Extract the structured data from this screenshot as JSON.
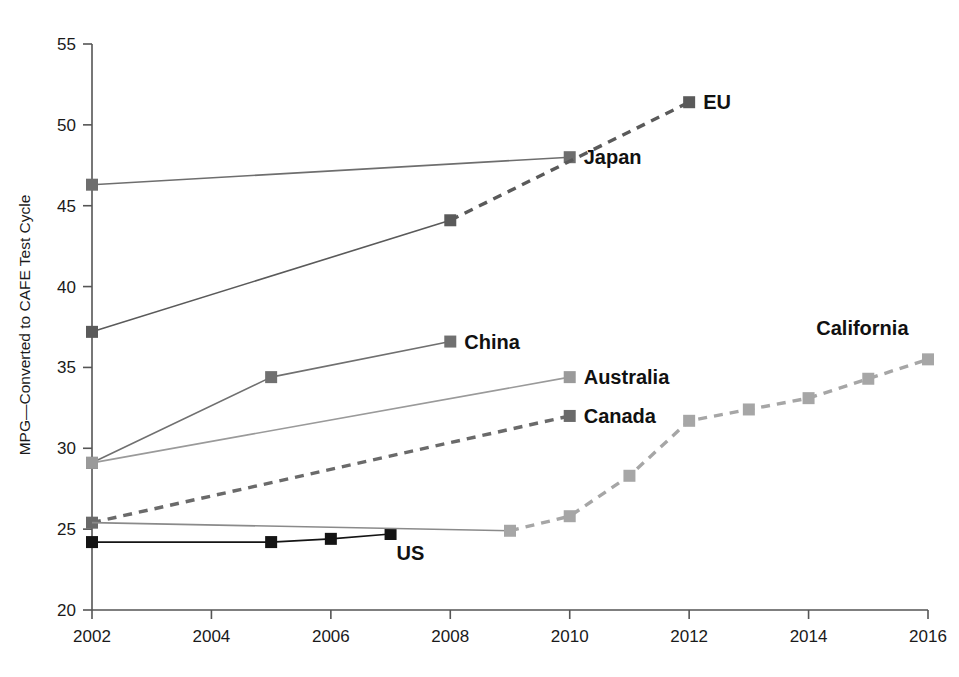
{
  "chart_data": {
    "type": "line",
    "title": "",
    "subtitle": "",
    "xlabel": "",
    "ylabel": "MPG—Converted to CAFE Test Cycle",
    "xlim": [
      2002,
      2016
    ],
    "ylim": [
      20,
      55
    ],
    "x_ticks": [
      2002,
      2004,
      2006,
      2008,
      2010,
      2012,
      2014,
      2016
    ],
    "x_tick_labels": [
      "2002",
      "2004",
      "2006",
      "2008",
      "2010",
      "2012",
      "2014",
      "2016"
    ],
    "y_ticks": [
      20,
      25,
      30,
      35,
      40,
      45,
      50,
      55
    ],
    "y_tick_labels": [
      "20",
      "25",
      "30",
      "35",
      "40",
      "45",
      "50",
      "55"
    ],
    "grid": false,
    "legend": "inline-end-labels",
    "series": [
      {
        "name": "Japan",
        "label": "Japan",
        "color": "#6e6e6e",
        "marker": "square",
        "linestyle": "solid",
        "x": [
          2002,
          2010
        ],
        "y": [
          46.3,
          48.0
        ],
        "label_x": 2010,
        "label_y": 48.0
      },
      {
        "name": "EU",
        "label": "EU",
        "color": "#5a5a5a",
        "marker": "square",
        "linestyle": "solid-then-dashed",
        "solid_until": 2008,
        "x": [
          2002,
          2008,
          2012
        ],
        "y": [
          37.2,
          44.1,
          51.4
        ],
        "label_x": 2012,
        "label_y": 51.4
      },
      {
        "name": "China",
        "label": "China",
        "color": "#707070",
        "marker": "square",
        "linestyle": "solid",
        "x": [
          2002,
          2005,
          2008
        ],
        "y": [
          29.1,
          34.4,
          36.6
        ],
        "label_x": 2008,
        "label_y": 36.6
      },
      {
        "name": "Australia",
        "label": "Australia",
        "color": "#9a9a9a",
        "marker": "square",
        "linestyle": "solid",
        "x": [
          2002,
          2010
        ],
        "y": [
          29.1,
          34.4
        ],
        "label_x": 2010,
        "label_y": 34.4
      },
      {
        "name": "Canada",
        "label": "Canada",
        "color": "#6a6a6a",
        "marker": "square",
        "linestyle": "dashed",
        "x": [
          2002,
          2010
        ],
        "y": [
          25.4,
          32.0
        ],
        "label_x": 2010,
        "label_y": 32.0
      },
      {
        "name": "US",
        "label": "US",
        "color": "#141414",
        "marker": "square",
        "linestyle": "solid",
        "x": [
          2002,
          2005,
          2006,
          2007
        ],
        "y": [
          24.2,
          24.2,
          24.4,
          24.7
        ],
        "label_x": 2007,
        "label_y": 24.7
      },
      {
        "name": "US-to-California-link",
        "label": "",
        "color": "#8a8a8a",
        "marker": "none",
        "linestyle": "solid",
        "x": [
          2002,
          2009
        ],
        "y": [
          25.4,
          24.9
        ],
        "label_x": null,
        "label_y": null
      },
      {
        "name": "California",
        "label": "California",
        "color": "#a6a6a6",
        "marker": "square",
        "linestyle": "dashed",
        "x": [
          2009,
          2010,
          2011,
          2012,
          2013,
          2014,
          2015,
          2016
        ],
        "y": [
          24.9,
          25.8,
          28.3,
          31.7,
          32.4,
          33.1,
          34.3,
          35.5
        ],
        "label_x": 2015,
        "label_y": 37.0
      }
    ],
    "annotations": []
  },
  "axes": {
    "y_axis_title": "MPG—Converted to CAFE Test Cycle"
  }
}
